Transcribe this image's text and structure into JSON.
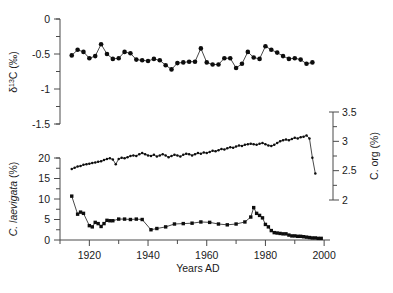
{
  "figure": {
    "background": "#ffffff",
    "marker_color": "#0d0d0d",
    "line_color": "#1a1a1a",
    "axis_color": "#4a4a4a"
  },
  "xaxis": {
    "label": "Years AD",
    "ticks": [
      "1920",
      "1940",
      "1960",
      "1980",
      "2000"
    ],
    "tick_values": [
      1920,
      1940,
      1960,
      1980,
      2000
    ],
    "minor_step": 10,
    "range": [
      1910,
      2002
    ]
  },
  "panels": {
    "top": {
      "ylabel_main": "C (",
      "ylabel_delta": "δ",
      "ylabel_sup": "13",
      "ylabel_unit": "‰)",
      "ylabel_full": "δ13C (‰)",
      "ticks": [
        "0",
        "-0.5",
        "-1",
        "-1.5"
      ],
      "tick_values": [
        0,
        -0.5,
        -1,
        -1.5
      ],
      "range": [
        -1.5,
        0
      ]
    },
    "right": {
      "ylabel": "C. org (%)",
      "ticks": [
        "3.5",
        "3",
        "2.5",
        "2"
      ],
      "tick_values": [
        3.5,
        3,
        2.5,
        2
      ],
      "range": [
        2,
        3.5
      ]
    },
    "bottom": {
      "ylabel": "C. laevigata (%)",
      "ticks": [
        "20",
        "15",
        "10",
        "5",
        "0"
      ],
      "tick_values": [
        20,
        15,
        10,
        5,
        0
      ],
      "range": [
        0,
        20
      ]
    }
  },
  "chart_data": [
    {
      "type": "line",
      "name": "d13C",
      "title": "",
      "xlabel": "Years AD",
      "ylabel": "δ13C (‰)",
      "xlim": [
        1910,
        2002
      ],
      "ylim": [
        -1.5,
        0
      ],
      "grid": false,
      "legend": "none",
      "markers": "filled-circle",
      "x": [
        1914,
        1916,
        1918,
        1920,
        1922,
        1924,
        1926,
        1928,
        1930,
        1932,
        1934,
        1936,
        1938,
        1940,
        1942,
        1944,
        1946,
        1948,
        1950,
        1952,
        1954,
        1956,
        1958,
        1960,
        1962,
        1964,
        1966,
        1968,
        1970,
        1972,
        1974,
        1976,
        1978,
        1980,
        1982,
        1984,
        1986,
        1988,
        1990,
        1992,
        1994,
        1996
      ],
      "y": [
        -0.52,
        -0.44,
        -0.47,
        -0.56,
        -0.53,
        -0.36,
        -0.5,
        -0.57,
        -0.56,
        -0.47,
        -0.49,
        -0.58,
        -0.59,
        -0.6,
        -0.57,
        -0.59,
        -0.66,
        -0.72,
        -0.63,
        -0.62,
        -0.61,
        -0.61,
        -0.42,
        -0.62,
        -0.65,
        -0.65,
        -0.56,
        -0.56,
        -0.7,
        -0.64,
        -0.47,
        -0.55,
        -0.57,
        -0.39,
        -0.44,
        -0.48,
        -0.53,
        -0.57,
        -0.56,
        -0.58,
        -0.64,
        -0.62
      ],
      "note": "values continue to lower panel portion of the same series"
    },
    {
      "type": "line",
      "name": "C. org",
      "ylabel": "C. org (%)",
      "xlim": [
        1910,
        2002
      ],
      "ylim": [
        2,
        3.5
      ],
      "grid": false,
      "legend": "none",
      "markers": "filled-circle",
      "x": [
        1914,
        1915,
        1916,
        1917,
        1918,
        1919,
        1920,
        1921,
        1922,
        1923,
        1924,
        1925,
        1926,
        1927,
        1928,
        1929,
        1930,
        1931,
        1932,
        1933,
        1934,
        1935,
        1936,
        1937,
        1938,
        1939,
        1940,
        1941,
        1942,
        1943,
        1944,
        1945,
        1946,
        1947,
        1948,
        1949,
        1950,
        1951,
        1952,
        1953,
        1954,
        1955,
        1956,
        1957,
        1958,
        1959,
        1960,
        1961,
        1962,
        1963,
        1964,
        1965,
        1966,
        1967,
        1968,
        1969,
        1970,
        1971,
        1972,
        1973,
        1974,
        1975,
        1976,
        1977,
        1978,
        1979,
        1980,
        1981,
        1982,
        1983,
        1984,
        1985,
        1986,
        1987,
        1988,
        1989,
        1990,
        1991,
        1992,
        1993,
        1994,
        1995,
        1996,
        1997
      ],
      "y": [
        2.53,
        2.55,
        2.57,
        2.58,
        2.6,
        2.61,
        2.62,
        2.63,
        2.64,
        2.65,
        2.66,
        2.68,
        2.7,
        2.71,
        2.69,
        2.61,
        2.7,
        2.72,
        2.71,
        2.73,
        2.75,
        2.76,
        2.75,
        2.78,
        2.8,
        2.78,
        2.76,
        2.75,
        2.77,
        2.74,
        2.76,
        2.78,
        2.76,
        2.73,
        2.75,
        2.77,
        2.76,
        2.74,
        2.77,
        2.79,
        2.78,
        2.76,
        2.78,
        2.8,
        2.79,
        2.81,
        2.8,
        2.82,
        2.84,
        2.83,
        2.85,
        2.87,
        2.86,
        2.88,
        2.9,
        2.89,
        2.91,
        2.93,
        2.92,
        2.94,
        2.95,
        2.96,
        2.95,
        2.94,
        2.96,
        2.97,
        2.95,
        2.93,
        2.92,
        2.94,
        2.97,
        3.0,
        3.02,
        3.03,
        3.02,
        3.04,
        3.06,
        3.05,
        3.07,
        3.08,
        3.1,
        3.05,
        2.72,
        2.45
      ]
    },
    {
      "type": "line",
      "name": "C. laevigata",
      "ylabel": "C. laevigata (%)",
      "xlim": [
        1910,
        2002
      ],
      "ylim": [
        0,
        20
      ],
      "grid": false,
      "legend": "none",
      "markers": "filled-square",
      "x": [
        1914,
        1916,
        1917,
        1918,
        1920,
        1921,
        1922,
        1923,
        1924,
        1925,
        1926,
        1927,
        1928,
        1930,
        1932,
        1934,
        1936,
        1938,
        1941,
        1943,
        1946,
        1949,
        1952,
        1955,
        1958,
        1961,
        1964,
        1967,
        1970,
        1973,
        1975,
        1976,
        1977,
        1978,
        1979,
        1980,
        1981,
        1982,
        1983,
        1984,
        1985,
        1986,
        1987,
        1988,
        1989,
        1990,
        1991,
        1992,
        1993,
        1994,
        1995,
        1996,
        1997,
        1998,
        1999
      ],
      "y": [
        10.7,
        6.3,
        6.8,
        6.5,
        3.5,
        3.2,
        4.3,
        4.0,
        3.3,
        4.0,
        4.8,
        4.7,
        4.7,
        5.1,
        5.1,
        5.0,
        5.1,
        5.0,
        2.5,
        2.8,
        3.2,
        3.9,
        4.0,
        4.1,
        4.4,
        4.3,
        3.9,
        3.7,
        3.9,
        4.4,
        5.6,
        7.9,
        6.5,
        6.0,
        5.4,
        3.8,
        3.2,
        2.3,
        1.8,
        1.7,
        1.6,
        1.5,
        1.5,
        1.2,
        1.0,
        1.0,
        0.9,
        0.9,
        0.8,
        0.7,
        0.6,
        0.5,
        0.5,
        0.4,
        0.4
      ]
    }
  ]
}
